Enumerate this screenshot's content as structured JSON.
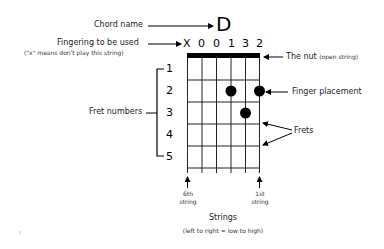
{
  "chord": {
    "name": "D",
    "fingering": [
      "X",
      "0",
      "0",
      "1",
      "3",
      "2"
    ]
  },
  "labels": {
    "chord_name": "Chord name",
    "fingering_title": "Fingering to be used",
    "fingering_note": "(\"x\" means don't play this string)",
    "nut": "The nut",
    "nut_note": "(open string)",
    "finger_placement": "Finger placement",
    "frets": "Frets",
    "fret_numbers": "Fret numbers",
    "sixth_string_line1": "6th",
    "sixth_string_line2": "string",
    "first_string_line1": "1st",
    "first_string_line2": "string",
    "strings_title": "Strings",
    "strings_note": "(left to right = low to high)"
  },
  "fret_numbers": [
    "1",
    "2",
    "3",
    "4",
    "5"
  ],
  "finger_dots": [
    {
      "string": 4,
      "fret": 2
    },
    {
      "string": 6,
      "fret": 2
    },
    {
      "string": 5,
      "fret": 3
    }
  ],
  "colors": {
    "ink": "#000000",
    "background": "#ffffff"
  }
}
